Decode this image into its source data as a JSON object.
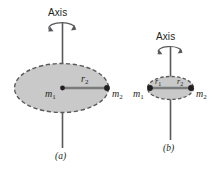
{
  "figure": {
    "kind": "physics-diagram",
    "background_color": "#ffffff",
    "disk_fill_color": "#c9c9c9",
    "disk_edge_color": "#58595b",
    "line_color": "#58595b",
    "marker_color": "#231f20",
    "text_color": "#231f20",
    "panels": [
      {
        "id": "a",
        "caption": "(a)",
        "axis_label": "Axis",
        "rotation_arrow": "curved-rotation-arrow",
        "labels": {
          "center_mass": "m",
          "center_mass_sub": "1",
          "radius": "r",
          "radius_sub": "2",
          "outer_mass": "m",
          "outer_mass_sub": "2"
        }
      },
      {
        "id": "b",
        "caption": "(b)",
        "axis_label": "Axis",
        "rotation_arrow": "curved-rotation-arrow",
        "labels": {
          "left_mass": "m",
          "left_mass_sub": "1",
          "radius_left": "r",
          "radius_left_sub": "1",
          "radius_right": "r",
          "radius_right_sub": "2",
          "right_mass": "m",
          "right_mass_sub": "2"
        }
      }
    ]
  }
}
